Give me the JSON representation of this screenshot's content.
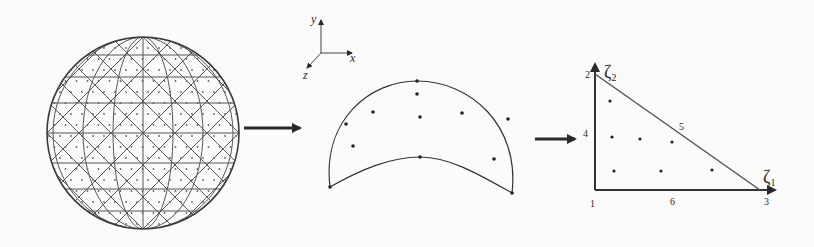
{
  "figure": {
    "colors": {
      "ink": "#2a2a2a",
      "mesh": "#555555",
      "background": "#fbfbfb"
    },
    "sphere": {
      "label": "triangulated-sphere-mesh",
      "center": [
        143,
        133
      ],
      "radius": 96
    },
    "axes": {
      "origin": [
        310,
        49
      ],
      "x_label": "x",
      "y_label": "y",
      "z_label": "z"
    },
    "curved_element": {
      "label": "curved-triangle-element",
      "nodes": [
        [
          417,
          81
        ],
        [
          417,
          94
        ],
        [
          373,
          112
        ],
        [
          420,
          117
        ],
        [
          462,
          113
        ],
        [
          346,
          124
        ],
        [
          508,
          119
        ],
        [
          353,
          146
        ],
        [
          420,
          157
        ],
        [
          494,
          159
        ],
        [
          330,
          187
        ],
        [
          512,
          193
        ]
      ]
    },
    "reference_triangle": {
      "axis1_label": "ζ",
      "axis1_sub": "1",
      "axis2_label": "ζ",
      "axis2_sub": "2",
      "vertex_labels": [
        "1",
        "2",
        "3"
      ],
      "midside_labels": [
        "4",
        "5",
        "6"
      ],
      "interior_points": [
        [
          610,
          101
        ],
        [
          612,
          137
        ],
        [
          640,
          139
        ],
        [
          672,
          142
        ],
        [
          614,
          171
        ],
        [
          661,
          171
        ],
        [
          712,
          170
        ]
      ]
    },
    "arrows": [
      "sphere-to-element",
      "element-to-reference"
    ]
  }
}
